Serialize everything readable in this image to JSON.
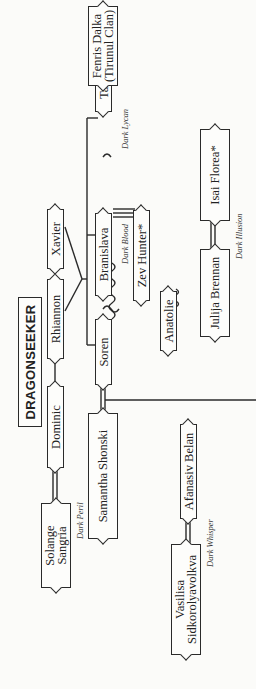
{
  "title": "DRAGONSEEKER",
  "nodes": {
    "solange": "Solange Sangria",
    "dominic": "Dominic",
    "rhiannon": "Rhiannon",
    "xavier": "Xavier",
    "samantha": "Samantha Shonski",
    "soren": "Soren",
    "anatolie": "Anatolie",
    "julija": "Julija Brennan",
    "isai": "Isai Florea*",
    "branislava": "Branislava",
    "zev": "Zev Hunter*",
    "tatijana": "Tatijana",
    "fenris": "Fenris Dalka (Tirunul Clan)",
    "vasilisa": "Vasilisa Sidkorolyavolkva",
    "afanasiv": "Afanasiv Belan"
  },
  "lineage_labels": {
    "dark_peril": "Dark Peril",
    "dark_blood": "Dark Blood",
    "dark_illusion": "Dark Illusion",
    "dark_lycan": "Dark Lycan",
    "dark_whisper": "Dark Whisper"
  }
}
